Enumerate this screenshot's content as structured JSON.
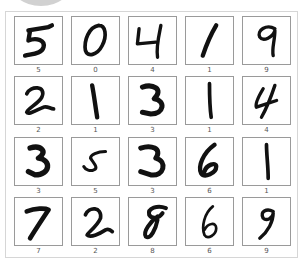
{
  "figure": {
    "rows": 4,
    "cols": 5,
    "digits": [
      {
        "label": "5"
      },
      {
        "label": "0"
      },
      {
        "label": "4"
      },
      {
        "label": "1"
      },
      {
        "label": "9"
      },
      {
        "label": "2"
      },
      {
        "label": "1"
      },
      {
        "label": "3"
      },
      {
        "label": "1"
      },
      {
        "label": "4"
      },
      {
        "label": "3"
      },
      {
        "label": "5"
      },
      {
        "label": "3"
      },
      {
        "label": "6"
      },
      {
        "label": "1"
      },
      {
        "label": "7"
      },
      {
        "label": "2"
      },
      {
        "label": "8"
      },
      {
        "label": "6"
      },
      {
        "label": "9"
      }
    ]
  }
}
